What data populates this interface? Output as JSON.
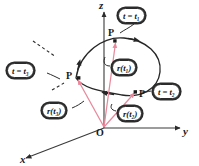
{
  "figure": {
    "kind": "vector-valued-function-space-curve",
    "background": "#ffffff",
    "axes": {
      "z_label": "z",
      "y_label": "y",
      "x_label": "x",
      "origin_label": "O",
      "axis_color": "#3a3a3a"
    },
    "curve": {
      "color": "#262626",
      "closed": true,
      "direction_arrows": 3
    },
    "vectors": {
      "color": "#e8889b",
      "count": 3,
      "from": "O"
    },
    "points": [
      {
        "name": "point-t1",
        "label": "P",
        "x": 115,
        "y": 41
      },
      {
        "name": "point-t2",
        "label": "P",
        "x": 136,
        "y": 92
      },
      {
        "name": "point-t3",
        "label": "P",
        "x": 76,
        "y": 78
      }
    ],
    "callouts": [
      {
        "name": "callout-t-equals-t1",
        "var": "t",
        "eq": "=",
        "fn": "t",
        "sub": "1",
        "text": "t = t₁",
        "x": 118,
        "y": 8
      },
      {
        "name": "callout-t-equals-t2",
        "var": "t",
        "eq": "=",
        "fn": "t",
        "sub": "2",
        "text": "t = t₂",
        "x": 153,
        "y": 84
      },
      {
        "name": "callout-t-equals-t3",
        "var": "t",
        "eq": "=",
        "fn": "t",
        "sub": "3",
        "text": "t = t₃",
        "x": 7,
        "y": 63
      },
      {
        "name": "callout-r-of-t1",
        "fnname": "r",
        "sub": "1",
        "text": "r(t₁)",
        "x": 112,
        "y": 60
      },
      {
        "name": "callout-r-of-t2",
        "fnname": "r",
        "sub": "2",
        "text": "r(t₂)",
        "x": 118,
        "y": 106
      },
      {
        "name": "callout-r-of-t3",
        "fnname": "r",
        "sub": "3",
        "text": "r(t₃)",
        "x": 42,
        "y": 103
      }
    ]
  }
}
